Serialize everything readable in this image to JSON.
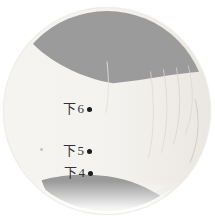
{
  "figure": {
    "type": "annotated-photo",
    "points": [
      {
        "label": "下6"
      },
      {
        "label": "下5"
      },
      {
        "label": "下4"
      }
    ],
    "colors": {
      "backdrop_gray": "#9b9b9b",
      "skin_light": "#f4f2ee",
      "label_text": "#333333",
      "point_dot": "#1c1c1c",
      "page_background": "#ffffff"
    }
  }
}
